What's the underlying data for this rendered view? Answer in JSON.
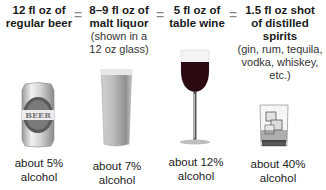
{
  "equivalence_sign": "=",
  "drinks": [
    {
      "id": "beer",
      "heading_lines": [
        "12 fl oz of",
        "regular beer"
      ],
      "note_lines": [],
      "icon": "beer-can-icon",
      "can_label": "BEER",
      "footer_lines": [
        "about 5%",
        "alcohol"
      ]
    },
    {
      "id": "malt-liquor",
      "heading_lines": [
        "8–9 fl oz of",
        "malt liquor"
      ],
      "note_lines": [
        "(shown in a",
        "12 oz glass)"
      ],
      "icon": "pint-glass-icon",
      "footer_lines": [
        "about 7%",
        "alcohol"
      ]
    },
    {
      "id": "wine",
      "heading_lines": [
        "5 fl oz of",
        "table wine"
      ],
      "note_lines": [],
      "icon": "wine-glass-icon",
      "footer_lines": [
        "about 12%",
        "alcohol"
      ]
    },
    {
      "id": "spirits",
      "heading_lines": [
        "1.5 fl oz shot",
        "of distilled",
        "spirits"
      ],
      "note_lines": [
        "(gin, rum, tequila,",
        "vodka, whiskey, etc.)"
      ],
      "icon": "rocks-glass-icon",
      "footer_lines": [
        "about 40%",
        "alcohol"
      ]
    }
  ],
  "colors": {
    "wine": "#2a0a10",
    "text": "#1a1a1a",
    "equals": "#888888"
  }
}
